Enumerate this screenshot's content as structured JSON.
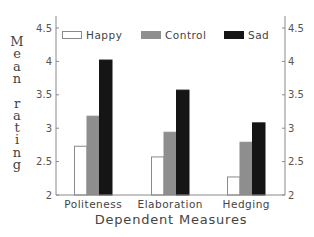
{
  "chart_data": {
    "type": "bar",
    "title": "",
    "xlabel": "Dependent Measures",
    "ylabel": "Mean rating",
    "categories": [
      "Politeness",
      "Elaboration",
      "Hedging"
    ],
    "series": [
      {
        "name": "Happy",
        "color": "#ffffff",
        "stroke": "#8a8a8a",
        "values": [
          2.73,
          2.57,
          2.27
        ]
      },
      {
        "name": "Control",
        "color": "#8e8e8e",
        "stroke": "#8e8e8e",
        "values": [
          3.18,
          2.94,
          2.79
        ]
      },
      {
        "name": "Sad",
        "color": "#151515",
        "stroke": "#151515",
        "values": [
          4.02,
          3.57,
          3.08
        ]
      }
    ],
    "ylim": [
      2,
      4.7
    ],
    "yticks": [
      2,
      2.5,
      3,
      3.5,
      4,
      4.5
    ],
    "ytick_labels": [
      "2",
      "2.5",
      "3",
      "3.5",
      "4",
      "4.5"
    ],
    "grid": false,
    "legend_position": "top, inside plot, horizontal",
    "right_axis_mirrored": true
  }
}
